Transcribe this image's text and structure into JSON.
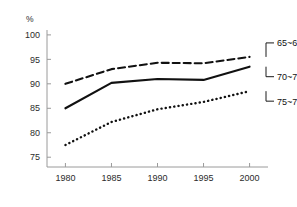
{
  "chart_data": {
    "type": "line",
    "title": "",
    "subtitle": "",
    "xlabel": "",
    "ylabel": "",
    "unit_label": "%",
    "x": [
      1980,
      1985,
      1990,
      1995,
      2000
    ],
    "categories": [
      "1980",
      "1985",
      "1990",
      "1995",
      "2000"
    ],
    "xlim": [
      1978,
      2002
    ],
    "ylim": [
      73,
      101
    ],
    "xticks": [
      "1980",
      "1985",
      "1990",
      "1995",
      "2000"
    ],
    "yticks": [
      "75",
      "80",
      "85",
      "90",
      "95",
      "100"
    ],
    "grid": false,
    "legend_position": "right-inline-labels",
    "series": [
      {
        "name": "65~69세",
        "style": "dashed",
        "values": [
          90.0,
          93.0,
          94.3,
          94.2,
          95.5
        ]
      },
      {
        "name": "70~74세",
        "style": "solid",
        "values": [
          85.0,
          90.2,
          91.0,
          90.8,
          93.5
        ]
      },
      {
        "name": "75~79세",
        "style": "dotted",
        "values": [
          77.5,
          82.2,
          84.8,
          86.3,
          88.5
        ]
      }
    ],
    "annotations": [
      {
        "label": "65~69세",
        "anchor_year": 2000,
        "anchor_value": 95.5
      },
      {
        "label": "70~74세",
        "anchor_year": 2000,
        "anchor_value": 93.5
      },
      {
        "label": "75~79세",
        "anchor_year": 2000,
        "anchor_value": 88.5
      }
    ]
  }
}
